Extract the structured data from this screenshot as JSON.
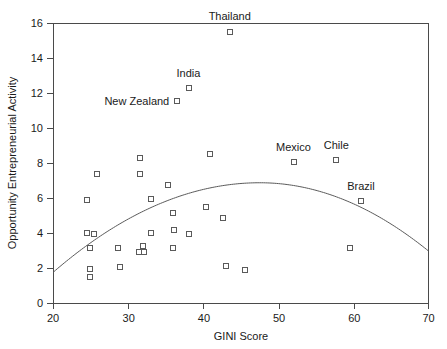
{
  "chart_data": {
    "type": "scatter",
    "title": "",
    "xlabel": "GINI Score",
    "ylabel": "Opportunity Entrepreneurial Activity",
    "xlim": [
      20,
      70
    ],
    "ylim": [
      0,
      16
    ],
    "xticks": [
      20,
      30,
      40,
      50,
      60,
      70
    ],
    "yticks": [
      0,
      2,
      4,
      6,
      8,
      10,
      12,
      14,
      16
    ],
    "grid": false,
    "legend": null,
    "marker_style": "open-square",
    "points": [
      {
        "x": 24.5,
        "y": 5.9,
        "label": null
      },
      {
        "x": 25.8,
        "y": 7.4,
        "label": null
      },
      {
        "x": 24.4,
        "y": 4.05,
        "label": null
      },
      {
        "x": 25.4,
        "y": 4.0,
        "label": null
      },
      {
        "x": 24.9,
        "y": 3.2,
        "label": null
      },
      {
        "x": 24.8,
        "y": 2.0,
        "label": null
      },
      {
        "x": 24.9,
        "y": 1.5,
        "label": null
      },
      {
        "x": 28.6,
        "y": 3.15,
        "label": null
      },
      {
        "x": 28.9,
        "y": 2.1,
        "label": null
      },
      {
        "x": 31.5,
        "y": 8.3,
        "label": null
      },
      {
        "x": 31.5,
        "y": 7.4,
        "label": null
      },
      {
        "x": 33.0,
        "y": 5.95,
        "label": null
      },
      {
        "x": 33.0,
        "y": 4.05,
        "label": null
      },
      {
        "x": 31.9,
        "y": 3.3,
        "label": null
      },
      {
        "x": 31.4,
        "y": 2.95,
        "label": null
      },
      {
        "x": 32.1,
        "y": 2.95,
        "label": null
      },
      {
        "x": 35.3,
        "y": 6.75,
        "label": null
      },
      {
        "x": 35.9,
        "y": 5.15,
        "label": null
      },
      {
        "x": 36.0,
        "y": 4.2,
        "label": null
      },
      {
        "x": 35.9,
        "y": 3.2,
        "label": null
      },
      {
        "x": 38.0,
        "y": 4.0,
        "label": null
      },
      {
        "x": 40.8,
        "y": 8.55,
        "label": null
      },
      {
        "x": 40.3,
        "y": 5.5,
        "label": null
      },
      {
        "x": 42.6,
        "y": 4.9,
        "label": null
      },
      {
        "x": 43.0,
        "y": 2.15,
        "label": null
      },
      {
        "x": 45.5,
        "y": 1.9,
        "label": null
      },
      {
        "x": 59.5,
        "y": 3.15,
        "label": null
      },
      {
        "x": 43.5,
        "y": 15.5,
        "label": "Thailand",
        "label_pos": "above",
        "label_dx": 0,
        "label_dy": -12
      },
      {
        "x": 38.0,
        "y": 12.3,
        "label": "India",
        "label_pos": "above",
        "label_dx": 0,
        "label_dy": -11
      },
      {
        "x": 36.5,
        "y": 11.55,
        "label": "New Zealand",
        "label_pos": "left",
        "label_dx": -8,
        "label_dy": 4
      },
      {
        "x": 52.0,
        "y": 8.1,
        "label": "Mexico",
        "label_pos": "above",
        "label_dx": 0,
        "label_dy": -11
      },
      {
        "x": 57.7,
        "y": 8.2,
        "label": "Chile",
        "label_pos": "above",
        "label_dx": 0,
        "label_dy": -11
      },
      {
        "x": 61.0,
        "y": 5.85,
        "label": "Brazil",
        "label_pos": "above",
        "label_dx": 0,
        "label_dy": -11
      }
    ],
    "fit_curve": {
      "type": "quadratic",
      "description": "inverted-U best fit curve",
      "vertex_x": 47.5,
      "vertex_y": 6.9,
      "x_start": 20,
      "x_end": 70,
      "y_start": 1.8,
      "y_end": 3.0
    }
  }
}
